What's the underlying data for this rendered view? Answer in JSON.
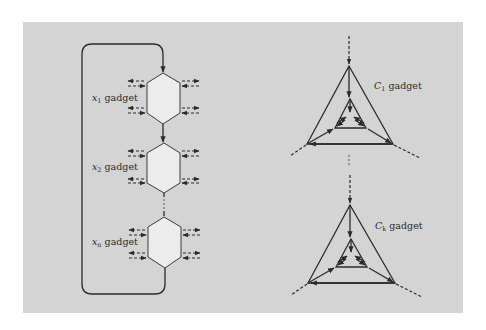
{
  "diagram": {
    "background_color": "#d4d4d4",
    "line_color": "#2a2a2a",
    "hex_fill": "#ececec",
    "variable_gadgets": [
      {
        "var": "x",
        "sub": "1",
        "suffix": " gadget",
        "label": "x1 gadget"
      },
      {
        "var": "x",
        "sub": "2",
        "suffix": " gadget",
        "label": "x2 gadget"
      },
      {
        "var": "x",
        "sub": "n",
        "suffix": " gadget",
        "label": "xn gadget"
      }
    ],
    "clause_gadgets": [
      {
        "var": "C",
        "sub": "1",
        "suffix": " gadget",
        "label": "C1 gadget"
      },
      {
        "var": "C",
        "sub": "k",
        "suffix": " gadget",
        "label": "Ck gadget"
      }
    ],
    "ellipsis": "⋮"
  }
}
